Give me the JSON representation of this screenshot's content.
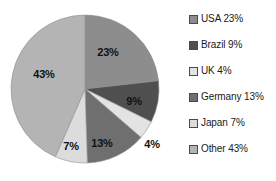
{
  "chart_data": {
    "type": "pie",
    "title": "",
    "xlabel": "",
    "ylabel": "",
    "legend_position": "right",
    "grid": false,
    "categories": [
      "USA",
      "Brazil",
      "UK",
      "Germany",
      "Japan",
      "Other"
    ],
    "values": [
      23,
      9,
      4,
      13,
      7,
      43
    ],
    "unit": "%",
    "start_angle_deg": 0,
    "direction": "clockwise",
    "slices": [
      {
        "name": "USA",
        "value": 23,
        "label": "23%",
        "legend_label": "USA 23%",
        "color": "#8d8d8d",
        "label_x": 108,
        "label_y": 52,
        "label_inside": true
      },
      {
        "name": "Brazil",
        "value": 9,
        "label": "9%",
        "legend_label": "Brazil 9%",
        "color": "#4f4f4f",
        "label_x": 134,
        "label_y": 101,
        "label_inside": true
      },
      {
        "name": "UK",
        "value": 4,
        "label": "4%",
        "legend_label": "UK 4%",
        "color": "#e3e3e3",
        "label_x": 152,
        "label_y": 144,
        "label_inside": false
      },
      {
        "name": "Germany",
        "value": 13,
        "label": "13%",
        "legend_label": "Germany 13%",
        "color": "#6f6f6f",
        "label_x": 102,
        "label_y": 143,
        "label_inside": true
      },
      {
        "name": "Japan",
        "value": 7,
        "label": "7%",
        "legend_label": "Japan 7%",
        "color": "#dcdcdc",
        "label_x": 71,
        "label_y": 146,
        "label_inside": true
      },
      {
        "name": "Other",
        "value": 43,
        "label": "43%",
        "legend_label": "Other 43%",
        "color": "#b4b4b4",
        "label_x": 44,
        "label_y": 74,
        "label_inside": true
      }
    ],
    "geometry": {
      "center_x": 85,
      "center_y": 89,
      "radius": 74
    }
  },
  "legend": {
    "items": [
      {
        "label": "USA 23%",
        "color": "#8d8d8d"
      },
      {
        "label": "Brazil 9%",
        "color": "#4f4f4f"
      },
      {
        "label": "UK 4%",
        "color": "#e3e3e3"
      },
      {
        "label": "Germany 13%",
        "color": "#6f6f6f"
      },
      {
        "label": "Japan 7%",
        "color": "#dcdcdc"
      },
      {
        "label": "Other 43%",
        "color": "#b4b4b4"
      }
    ]
  }
}
